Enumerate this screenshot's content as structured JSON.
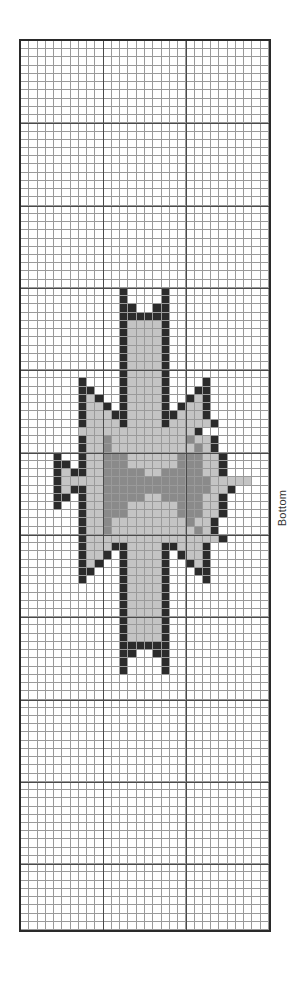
{
  "page": {
    "side_label": "Bottom"
  },
  "chart_grid": {
    "columns": 30,
    "rows": 108,
    "major_every": 10,
    "legend": {
      "b": {
        "name": "black",
        "color": "#2b2b2b"
      },
      "l": {
        "name": "light-gray",
        "color": "#c4c4c4"
      },
      "d": {
        "name": "dark-gray",
        "color": "#8a8a8a"
      },
      ".": {
        "name": "empty",
        "color": "#ffffff"
      }
    },
    "pattern_start_row": 30,
    "pattern_rows": [
      "............b....b............",
      "............b....b............",
      "............bb..bb............",
      "............bbbbbb............",
      "............bllllb............",
      "............bllllb............",
      "............bllllb............",
      "............bllllb............",
      "............bllllb............",
      "............bllllb............",
      "............bllllb............",
      ".......b....bllllb....b.......",
      ".......bb...bllllb...bb.......",
      ".......blb..bllllb..blb.......",
      ".......bllb.bllllb.bllb.......",
      ".......blllbbllllbblllb.......",
      ".......bllllbllllblllllb......",
      ".......llllllllllllllb........",
      ".......blldllllllllldllb......",
      ".......blldlllllllllldlb......",
      "....b..blldddlllllldddllb.....",
      "....bb.blldddlllllldddllb.....",
      "....blbblldddddlldddddllb.....",
      "....bllllldddddddddddddlllll..",
      "....blbblldddddddddddddllb....",
      "....bb.blldddddlldddddllb.....",
      "....b..blldddlllllldddllb.....",
      ".......blldddlllllldddllb.....",
      ".......blldllllllllldllb......",
      ".......blldlllllllllldlb......",
      ".......bllllllllllllllllb......",
      ".......blllbbllllbblllb.......",
      ".......bllb.bllllb.bllb.......",
      ".......blb..bllllb..blb.......",
      ".......bb...bllllb...bb.......",
      ".......b....bllllb....b.......",
      "............bllllb............",
      "............bllllb............",
      "............bllllb............",
      "............bllllb............",
      "............bllllb............",
      "............bllllb............",
      "............bllllb............",
      "............bbbbbb............",
      "............bb..bb............",
      "............b....b............",
      "............b....b............"
    ]
  }
}
